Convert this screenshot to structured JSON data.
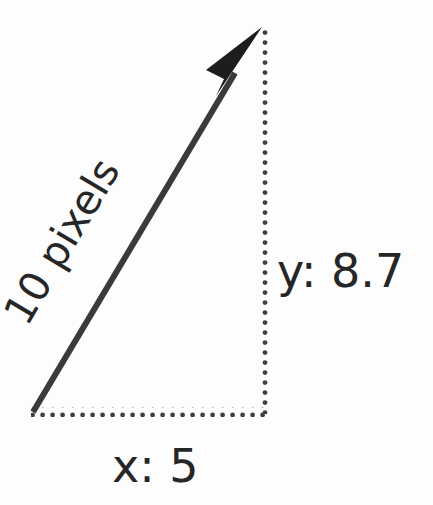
{
  "diagram": {
    "background_color": "#fdfdfd",
    "stroke_color": "#3a3a3a",
    "text_color": "#262626",
    "labels": {
      "hypotenuse": "10 pixels",
      "vertical": "y: 8.7",
      "horizontal": "x: 5"
    },
    "values": {
      "magnitude": 10,
      "magnitude_unit": "pixels",
      "y_component": 8.7,
      "x_component": 5,
      "angle_degrees": 60
    },
    "geometry": {
      "origin": {
        "x": 33,
        "y": 412
      },
      "tip": {
        "x": 262,
        "y": 28
      },
      "corner": {
        "x": 262,
        "y": 412
      },
      "arrow_stroke_width": 6,
      "dot_radius": 2.4,
      "dot_pitch": 10
    }
  }
}
